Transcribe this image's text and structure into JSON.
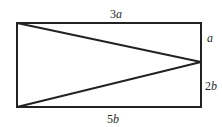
{
  "diagram": {
    "type": "geometry",
    "rectangle": {
      "x": 17,
      "y": 23,
      "width": 184,
      "height": 84
    },
    "triangle_apex": {
      "x": 201,
      "y": 62
    },
    "labels": {
      "top": {
        "coef": "3",
        "var": "a"
      },
      "right_upper": {
        "coef": "",
        "var": "a"
      },
      "right_lower": {
        "coef": "2",
        "var": "b"
      },
      "bottom": {
        "coef": "5",
        "var": "b"
      }
    },
    "colors": {
      "stroke": "#222222",
      "background": "#ffffff"
    }
  }
}
